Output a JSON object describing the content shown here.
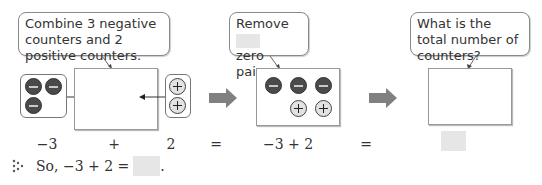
{
  "step1": {
    "callout": "Combine 3 negative counters and 2 positive counters.",
    "negative_count": 3,
    "positive_count": 2
  },
  "step2": {
    "callout_prefix": "Remove",
    "callout_suffix": "zero pairs.",
    "negative_count": 3,
    "positive_count": 2
  },
  "step3": {
    "callout": "What is the total number of counters?"
  },
  "equation_row": {
    "term1": "−3",
    "op1": "+",
    "term2": "2",
    "eq1": "=",
    "expr": "−3 + 2",
    "eq2": "=",
    "result": ""
  },
  "conclusion": {
    "text": "So, −3 + 2 =",
    "answer": "",
    "period": "."
  },
  "colors": {
    "negative_counter": "#4a4a4a",
    "positive_counter": "#e2e2e2",
    "arrow": "#808080",
    "blank": "#e6e6e6"
  }
}
